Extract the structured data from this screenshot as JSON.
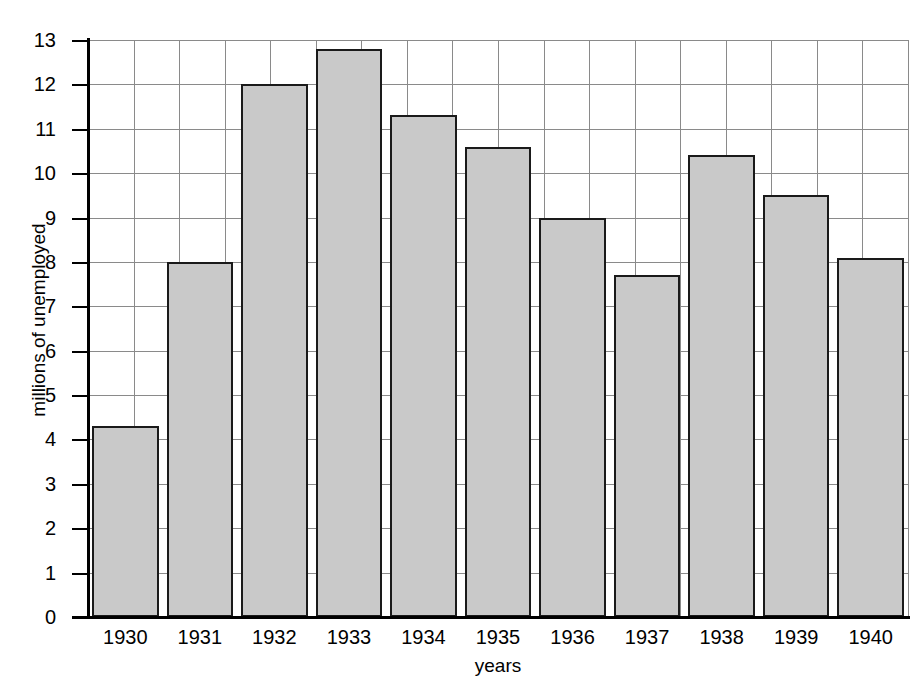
{
  "chart_data": {
    "type": "bar",
    "title": "",
    "xlabel": "years",
    "ylabel": "millions of unemployed",
    "categories": [
      "1930",
      "1931",
      "1932",
      "1933",
      "1934",
      "1935",
      "1936",
      "1937",
      "1938",
      "1939",
      "1940"
    ],
    "values": [
      4.3,
      8.0,
      12.0,
      12.8,
      11.3,
      10.6,
      9.0,
      7.7,
      10.4,
      9.5,
      8.1
    ],
    "ylim": [
      0,
      13
    ],
    "ytick_labels": [
      "0",
      "1",
      "2",
      "3",
      "4",
      "5",
      "6",
      "7",
      "8",
      "9",
      "10",
      "11",
      "12",
      "13"
    ],
    "ytick_values": [
      0,
      1,
      2,
      3,
      4,
      5,
      6,
      7,
      8,
      9,
      10,
      11,
      12,
      13
    ],
    "y_tick_step": 1,
    "grid": "both",
    "grid_vertical_count": 18,
    "legend": "none",
    "legend_position": "none",
    "bar_fill_color": "#c9c9c9",
    "bar_edge_color": "#1a1a1a",
    "grid_color": "#8a8a8a",
    "axis_color": "#000000",
    "background_color": "#ffffff"
  }
}
